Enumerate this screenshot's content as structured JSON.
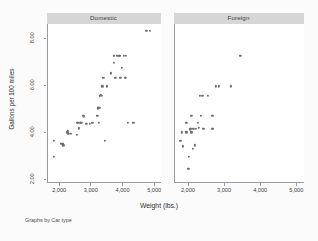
{
  "figure": {
    "note": "Graphs by Car type",
    "xtitle": "Weight (lbs.)",
    "ytitle": "Gallons per 100 miles",
    "background": "#fbfbfb",
    "panel_background": "#ffffff",
    "marker_color": "#6e6e6e",
    "strip_color": "#d6d6d6",
    "axis_color": "#9a9a9a"
  },
  "panels": [
    {
      "label": "Domestic"
    },
    {
      "label": "Foreign"
    }
  ],
  "chart_data": {
    "type": "scatter",
    "title": "",
    "subtitle": "",
    "xlabel": "Weight (lbs.)",
    "ylabel": "Gallons per 100 miles",
    "note": "Graphs by Car type",
    "facet_by": "Car type",
    "grid": false,
    "legend": "none",
    "xlim": [
      1600,
      5200
    ],
    "ylim": [
      1.85,
      8.6
    ],
    "xticks": [
      2000,
      3000,
      4000,
      5000
    ],
    "xtick_labels": [
      "2,000",
      "3,000",
      "4,000",
      "5,000"
    ],
    "yticks": [
      2.0,
      4.0,
      6.0,
      8.0
    ],
    "ytick_labels": [
      "2.00",
      "4.00",
      "6.00",
      "8.00"
    ],
    "series": [
      {
        "name": "Domestic",
        "panel": 0,
        "x": [
          1800,
          1800,
          2020,
          2070,
          2070,
          2100,
          2230,
          2240,
          2260,
          2330,
          2520,
          2540,
          2560,
          2580,
          2600,
          2640,
          2670,
          2730,
          2750,
          2830,
          2930,
          3020,
          3170,
          3180,
          3180,
          3200,
          3210,
          3220,
          3240,
          3250,
          3260,
          3280,
          3310,
          3330,
          3350,
          3370,
          3420,
          3470,
          3600,
          3690,
          3690,
          3700,
          3740,
          3790,
          3830,
          3870,
          3880,
          3900,
          3950,
          4020,
          4060,
          4080,
          4130,
          4290,
          4330,
          4720,
          4840
        ],
        "y": [
          3.65,
          2.95,
          3.5,
          3.5,
          3.5,
          3.45,
          4.0,
          4.05,
          3.95,
          3.95,
          3.9,
          4.4,
          4.4,
          4.15,
          4.2,
          4.4,
          4.4,
          4.7,
          4.65,
          4.35,
          4.35,
          4.4,
          4.7,
          5.0,
          5.05,
          5.05,
          5.05,
          4.4,
          5.05,
          5.55,
          5.55,
          5.6,
          5.55,
          5.95,
          6.3,
          6.3,
          3.65,
          5.95,
          6.5,
          6.95,
          7.25,
          7.25,
          6.3,
          7.25,
          7.25,
          7.25,
          7.25,
          6.3,
          6.75,
          7.25,
          6.3,
          7.25,
          4.4,
          4.4,
          4.4,
          8.3,
          8.3
        ]
      },
      {
        "name": "Foreign",
        "panel": 1,
        "x": [
          1760,
          1800,
          1830,
          1930,
          1930,
          1980,
          2000,
          2020,
          2040,
          2050,
          2070,
          2070,
          2100,
          2120,
          2160,
          2200,
          2240,
          2280,
          2300,
          2330,
          2370,
          2400,
          2520,
          2650,
          2650,
          2670,
          2750,
          2830,
          3170,
          3420
        ],
        "y": [
          3.65,
          4.0,
          3.4,
          4.4,
          4.0,
          2.45,
          2.95,
          4.1,
          4.15,
          4.15,
          4.7,
          4.0,
          3.3,
          4.15,
          3.45,
          4.15,
          4.4,
          4.2,
          5.55,
          4.7,
          5.55,
          4.15,
          5.55,
          4.7,
          4.15,
          4.15,
          5.95,
          5.95,
          5.95,
          7.25
        ]
      }
    ]
  }
}
